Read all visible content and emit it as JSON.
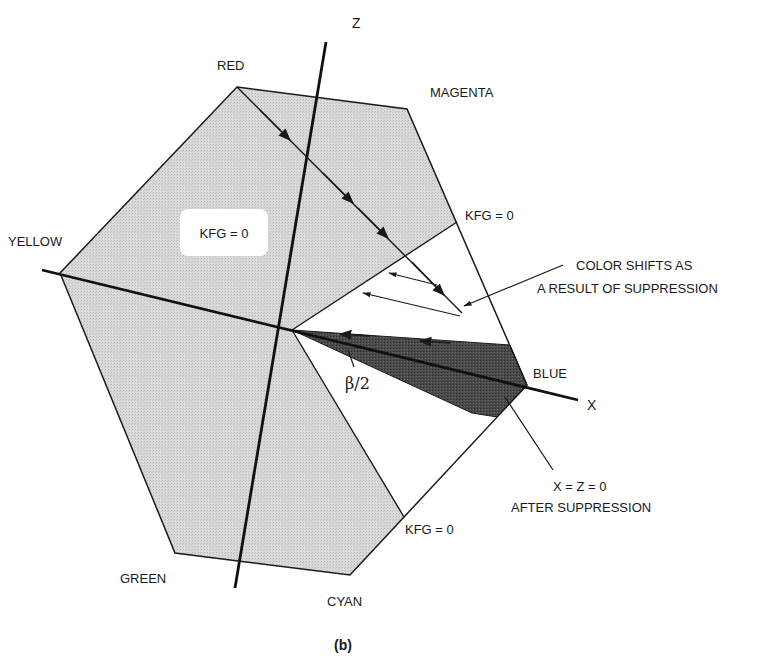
{
  "figure": {
    "caption": "(b)",
    "axes": {
      "z_label": "Z",
      "x_label": "X"
    },
    "vertices": {
      "red": "RED",
      "magenta": "MAGENTA",
      "blue": "BLUE",
      "cyan": "CYAN",
      "green": "GREEN",
      "yellow": "YELLOW"
    },
    "region_label": "KFG = 0",
    "boundary_labels": {
      "upper": "KFG = 0",
      "lower": "KFG = 0"
    },
    "angle_label": "β/2",
    "annotations": {
      "color_shifts_line1": "COLOR SHIFTS AS",
      "color_shifts_line2": "A RESULT OF SUPPRESSION",
      "after_suppression_line1": "X = Z = 0",
      "after_suppression_line2": "AFTER SUPPRESSION"
    },
    "colors": {
      "light_region": "#d6d6d6",
      "dark_region": "#4a4a4a",
      "lines": "#1a1a1a",
      "background": "#ffffff"
    }
  }
}
